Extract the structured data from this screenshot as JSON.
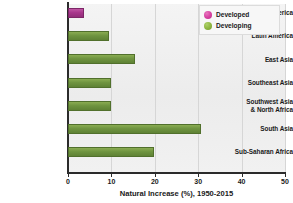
{
  "chart_data": {
    "type": "bar",
    "orientation": "horizontal",
    "title": "",
    "xlabel": "Natural Increase (%), 1950-2015",
    "ylabel": "",
    "xlim": [
      0,
      50
    ],
    "xticks": [
      0,
      10,
      20,
      30,
      40,
      50
    ],
    "xtick_labels": [
      "0",
      "10",
      "20",
      "30",
      "40",
      "50"
    ],
    "grid": true,
    "grid_axis": "x",
    "legend_position": "top-right",
    "categories": [
      "North America",
      "Latin America",
      "East Asia",
      "Southeast Asia",
      "Southwest Asia & North Africa",
      "South Asia",
      "Sub-Saharan Africa"
    ],
    "values": [
      3.8,
      9.4,
      15.4,
      9.8,
      9.8,
      30.6,
      19.8
    ],
    "groups": [
      "Developed",
      "Developing",
      "Developing",
      "Developing",
      "Developing",
      "Developing",
      "Developing"
    ],
    "series": [
      {
        "name": "Developed",
        "color": "#a8368c",
        "points": [
          {
            "category": "North America",
            "value": 3.8
          }
        ]
      },
      {
        "name": "Developing",
        "color": "#6f9440",
        "points": [
          {
            "category": "Latin America",
            "value": 9.4
          },
          {
            "category": "East Asia",
            "value": 15.4
          },
          {
            "category": "Southeast Asia",
            "value": 9.8
          },
          {
            "category": "Southwest Asia & North Africa",
            "value": 9.8
          },
          {
            "category": "South Asia",
            "value": 30.6
          },
          {
            "category": "Sub-Saharan Africa",
            "value": 19.8
          }
        ]
      }
    ]
  },
  "axis": {
    "x_title": "Natural Increase (%), 1950-2015",
    "ticks": [
      {
        "value": 0,
        "label": "0"
      },
      {
        "value": 10,
        "label": "10"
      },
      {
        "value": 20,
        "label": "20"
      },
      {
        "value": 30,
        "label": "30"
      },
      {
        "value": 40,
        "label": "40"
      },
      {
        "value": 50,
        "label": "50"
      }
    ]
  },
  "categories": [
    {
      "line1": "North America",
      "line2": "",
      "value": 3.8,
      "group": "Developed"
    },
    {
      "line1": "Latin America",
      "line2": "",
      "value": 9.4,
      "group": "Developing"
    },
    {
      "line1": "East Asia",
      "line2": "",
      "value": 15.4,
      "group": "Developing"
    },
    {
      "line1": "Southeast Asia",
      "line2": "",
      "value": 9.8,
      "group": "Developing"
    },
    {
      "line1": "Southwest Asia",
      "line2": "& North Africa",
      "value": 9.8,
      "group": "Developing"
    },
    {
      "line1": "South Asia",
      "line2": "",
      "value": 30.6,
      "group": "Developing"
    },
    {
      "line1": "Sub-Saharan Africa",
      "line2": "",
      "value": 19.8,
      "group": "Developing"
    }
  ],
  "legend": {
    "items": [
      {
        "label": "Developed",
        "color": "#d63fa0",
        "key": "developed"
      },
      {
        "label": "Developing",
        "color": "#8db53f",
        "key": "developing"
      }
    ]
  },
  "colors": {
    "developed": "#a8368c",
    "developing": "#6f9440",
    "legend_developed": "#d63fa0",
    "legend_developing": "#8db53f",
    "plot_background": "#efefef",
    "axis": "#2b2b2b",
    "gridline": "#d6d6d6",
    "text": "#1a1a1a"
  }
}
